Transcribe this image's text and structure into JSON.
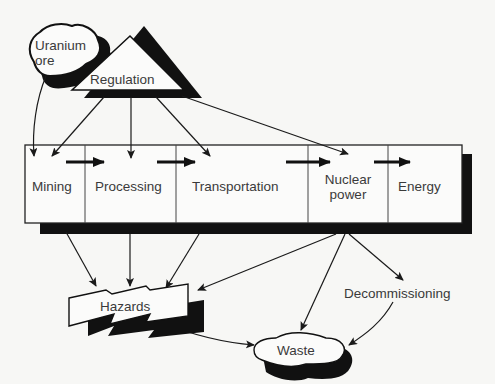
{
  "diagram": {
    "nodes": {
      "uranium_ore": {
        "line1": "Uranium",
        "line2": "ore"
      },
      "regulation": {
        "label": "Regulation"
      },
      "stages": [
        {
          "label": "Mining"
        },
        {
          "label": "Processing"
        },
        {
          "label": "Transportation"
        },
        {
          "line1": "Nuclear",
          "line2": "power"
        },
        {
          "label": "Energy"
        }
      ],
      "hazards": {
        "label": "Hazards"
      },
      "decommissioning": {
        "label": "Decommissioning"
      },
      "waste": {
        "label": "Waste"
      }
    },
    "edges": [
      [
        "Uranium ore",
        "Mining"
      ],
      [
        "Regulation",
        "Mining"
      ],
      [
        "Regulation",
        "Processing"
      ],
      [
        "Regulation",
        "Transportation"
      ],
      [
        "Regulation",
        "Nuclear power"
      ],
      [
        "Mining",
        "Processing"
      ],
      [
        "Processing",
        "Transportation"
      ],
      [
        "Transportation",
        "Nuclear power"
      ],
      [
        "Nuclear power",
        "Energy"
      ],
      [
        "Mining",
        "Hazards"
      ],
      [
        "Processing",
        "Hazards"
      ],
      [
        "Transportation",
        "Hazards"
      ],
      [
        "Nuclear power",
        "Hazards"
      ],
      [
        "Nuclear power",
        "Waste"
      ],
      [
        "Nuclear power",
        "Decommissioning"
      ],
      [
        "Decommissioning",
        "Waste"
      ],
      [
        "Hazards",
        "Waste"
      ]
    ]
  }
}
